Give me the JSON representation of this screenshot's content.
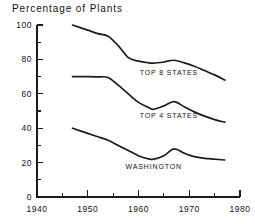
{
  "chart_data": {
    "type": "line",
    "title": "Percentage of Plants",
    "xlabel": "",
    "ylabel": "",
    "xlim": [
      1940,
      1980
    ],
    "ylim": [
      0,
      100
    ],
    "grid": false,
    "legend_position": "inline-labels",
    "x_ticks_major": [
      1940,
      1950,
      1960,
      1970,
      1980
    ],
    "x_ticks_minor": [
      1945,
      1955,
      1965,
      1975
    ],
    "y_ticks_major": [
      0,
      20,
      40,
      60,
      80,
      100
    ],
    "y_ticks_minor": [
      10,
      30,
      50,
      70,
      90
    ],
    "x_tick_labels": [
      "1940",
      "1950",
      "1960",
      "1970",
      "1980"
    ],
    "y_tick_labels": [
      "0",
      "20",
      "40",
      "60",
      "80",
      "100"
    ],
    "series": [
      {
        "name": "TOP 8 STATES",
        "label": "TOP 8 STATES",
        "label_x": 1966,
        "label_y": 71,
        "x": [
          1947,
          1950,
          1952,
          1954,
          1956,
          1958,
          1960,
          1962,
          1963,
          1965,
          1967,
          1969,
          1971,
          1973,
          1975,
          1977
        ],
        "values": [
          100,
          97,
          95,
          93.5,
          88,
          81,
          79,
          78,
          77.8,
          78.5,
          79.5,
          78,
          76,
          73.5,
          71,
          68
        ]
      },
      {
        "name": "TOP 4 STATES",
        "label": "TOP 4 STATES",
        "label_x": 1966,
        "label_y": 46,
        "x": [
          1947,
          1950,
          1952,
          1954,
          1956,
          1958,
          1960,
          1962,
          1963,
          1965,
          1967,
          1969,
          1971,
          1973,
          1975,
          1977
        ],
        "values": [
          70,
          70,
          69.8,
          69.5,
          65,
          60,
          55,
          52,
          51,
          53,
          55.5,
          52.5,
          49.5,
          47,
          45,
          43.5
        ]
      },
      {
        "name": "WASHINGTON",
        "label": "WASHINGTON",
        "label_x": 1963,
        "label_y": 16.5,
        "x": [
          1947,
          1950,
          1952,
          1954,
          1956,
          1958,
          1960,
          1962,
          1963,
          1965,
          1967,
          1969,
          1971,
          1973,
          1975,
          1977
        ],
        "values": [
          40,
          37,
          35,
          33,
          30,
          27,
          24,
          22.2,
          22,
          24,
          28,
          25.5,
          23.5,
          22.5,
          22,
          21.5
        ]
      }
    ]
  }
}
